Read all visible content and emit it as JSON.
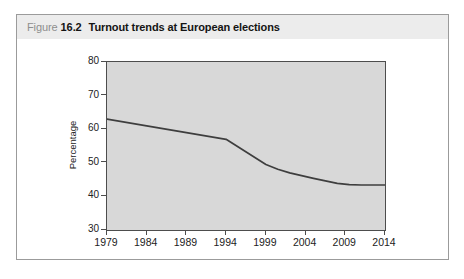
{
  "figure": {
    "label_prefix": "Figure",
    "number": "16.2",
    "title": "Turnout trends at European elections"
  },
  "chart_data": {
    "type": "line",
    "title": "Turnout trends at European elections",
    "categories": [
      1979,
      1984,
      1989,
      1994,
      1999,
      2004,
      2009,
      2014
    ],
    "values": [
      63,
      61,
      59,
      57,
      49.5,
      46,
      43.5,
      43.5
    ],
    "series_name": "Turnout",
    "xlabel": "",
    "ylabel": "Percentage",
    "xlim": [
      1979,
      2014
    ],
    "ylim": [
      30,
      80
    ],
    "yticks": [
      30,
      40,
      50,
      60,
      70,
      80
    ],
    "grid": false,
    "legend": false,
    "curve": [
      [
        1979,
        63
      ],
      [
        1984,
        61
      ],
      [
        1989,
        59
      ],
      [
        1994,
        57
      ],
      [
        1999,
        49.5
      ],
      [
        2000.5,
        48.1
      ],
      [
        2002,
        47.0
      ],
      [
        2003.5,
        46.2
      ],
      [
        2005,
        45.4
      ],
      [
        2006.5,
        44.6
      ],
      [
        2008,
        43.9
      ],
      [
        2009.5,
        43.5
      ],
      [
        2011,
        43.4
      ],
      [
        2012.5,
        43.4
      ],
      [
        2014,
        43.4
      ]
    ]
  },
  "colors": {
    "header_bg": "#ececec",
    "figure_label": "#8e8e8e",
    "title_text": "#141414",
    "box_border": "#9b9b9b",
    "plot_bg": "#d8d8d8",
    "plot_border": "#4d4d4d",
    "line": "#3e3e3e",
    "tick_text": "#222222"
  }
}
